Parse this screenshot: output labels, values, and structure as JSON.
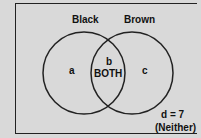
{
  "venn": {
    "set_left": "Black",
    "set_right": "Brown",
    "region_left": "a",
    "region_mid_letter": "b",
    "region_mid_label": "BOTH",
    "region_right": "c",
    "outside_value": "d = 7",
    "outside_label": "(Neither)"
  },
  "colors": {
    "background": "#d9d9d9",
    "stroke": "#222222",
    "text": "#111111"
  }
}
